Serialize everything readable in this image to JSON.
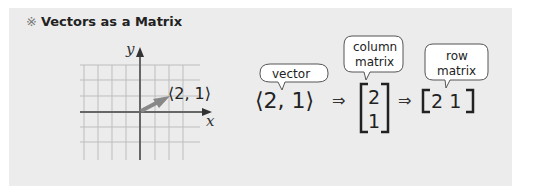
{
  "header": {
    "mark": "※",
    "title": "Vectors as a Matrix"
  },
  "graph": {
    "x_label": "x",
    "y_label": "y",
    "vector_label": "⟨2, 1⟩",
    "vector": [
      2,
      1
    ]
  },
  "notation": {
    "vector_expr": "⟨2, 1⟩",
    "arrow1": "⇒",
    "arrow2": "⇒",
    "column_entries": [
      "2",
      "1"
    ],
    "row_entries": "2 1",
    "bubbles": {
      "vector": "vector",
      "column_line1": "column",
      "column_line2": "matrix",
      "row_line1": "row",
      "row_line2": "matrix"
    }
  },
  "colors": {
    "panel": "#ececec",
    "grid": "#bdbdbd",
    "axis": "#666666",
    "vector": "#888888"
  }
}
